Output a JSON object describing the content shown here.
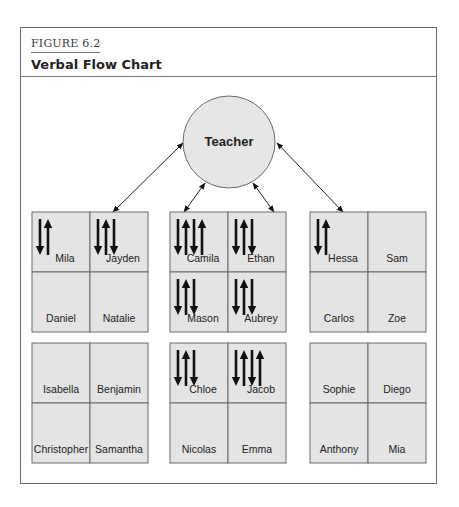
{
  "figure": {
    "label": "FIGURE 6.2",
    "title": "Verbal Flow Chart"
  },
  "teacher": {
    "label": "Teacher"
  },
  "colors": {
    "frame_border": "#6f6f6f",
    "cell_fill": "#e4e4e4",
    "cell_border": "#6a6a6a",
    "circle_fill": "#e6e6e6",
    "arrow": "#111111"
  },
  "groups": [
    {
      "id": "group-1",
      "students": [
        {
          "name": "Mila",
          "arrows": [
            "down",
            "up"
          ]
        },
        {
          "name": "Jayden",
          "arrows": [
            "down",
            "up",
            "down"
          ]
        },
        {
          "name": "Daniel",
          "arrows": []
        },
        {
          "name": "Natalie",
          "arrows": []
        }
      ]
    },
    {
      "id": "group-2",
      "students": [
        {
          "name": "Camila",
          "arrows": [
            "down",
            "up",
            "down",
            "up"
          ]
        },
        {
          "name": "Ethan",
          "arrows": [
            "down",
            "up",
            "down"
          ]
        },
        {
          "name": "Mason",
          "arrows": [
            "down",
            "up",
            "down"
          ]
        },
        {
          "name": "Aubrey",
          "arrows": [
            "down",
            "up",
            "down"
          ]
        }
      ]
    },
    {
      "id": "group-3",
      "students": [
        {
          "name": "Hessa",
          "arrows": [
            "down",
            "up"
          ]
        },
        {
          "name": "Sam",
          "arrows": []
        },
        {
          "name": "Carlos",
          "arrows": []
        },
        {
          "name": "Zoe",
          "arrows": []
        }
      ]
    },
    {
      "id": "group-4",
      "students": [
        {
          "name": "Isabella",
          "arrows": []
        },
        {
          "name": "Benjamin",
          "arrows": []
        },
        {
          "name": "Christopher",
          "arrows": []
        },
        {
          "name": "Samantha",
          "arrows": []
        }
      ]
    },
    {
      "id": "group-5",
      "students": [
        {
          "name": "Chloe",
          "arrows": [
            "down",
            "up",
            "down"
          ]
        },
        {
          "name": "Jacob",
          "arrows": [
            "down",
            "up",
            "down",
            "up"
          ]
        },
        {
          "name": "Nicolas",
          "arrows": []
        },
        {
          "name": "Emma",
          "arrows": []
        }
      ]
    },
    {
      "id": "group-6",
      "students": [
        {
          "name": "Sophie",
          "arrows": []
        },
        {
          "name": "Diego",
          "arrows": []
        },
        {
          "name": "Anthony",
          "arrows": []
        },
        {
          "name": "Mia",
          "arrows": []
        }
      ]
    }
  ],
  "connections": [
    {
      "from": "Teacher",
      "to": "group-1 (Jayden)",
      "type": "bidirectional"
    },
    {
      "from": "Teacher",
      "to": "group-2 (Camila)",
      "type": "bidirectional"
    },
    {
      "from": "Teacher",
      "to": "group-2 (Ethan)",
      "type": "bidirectional"
    },
    {
      "from": "Teacher",
      "to": "group-3 (Hessa)",
      "type": "bidirectional"
    }
  ]
}
